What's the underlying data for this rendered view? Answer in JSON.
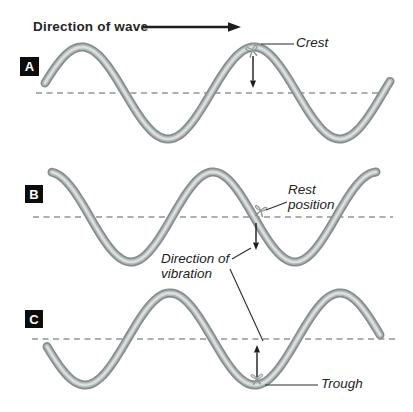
{
  "header": {
    "label": "Direction of wave"
  },
  "panels": [
    {
      "letter": "A"
    },
    {
      "letter": "B"
    },
    {
      "letter": "C"
    }
  ],
  "labels": {
    "crest": "Crest",
    "rest_position": "Rest\nposition",
    "direction_of_vibration": "Direction of\nvibration",
    "trough": "Trough"
  },
  "colors": {
    "background": "#ffffff",
    "rope_outer": "#868c8c",
    "rope_mid": "#b2b8b8",
    "rope_core": "#dbdfdf",
    "rest_line": "#8f9595",
    "arrow": "#1c1c1c",
    "text": "#222222",
    "panel_box": "#0c0c0c",
    "panel_letter": "#ffffff"
  },
  "diagram": {
    "header_arrow": {
      "x1": 143,
      "y1": 27,
      "x2": 241,
      "y2": 27
    },
    "rest_lines": [
      {
        "panel": "A",
        "y": 93,
        "x1": 36,
        "x2": 392
      },
      {
        "panel": "B",
        "y": 217,
        "x1": 33,
        "x2": 393
      },
      {
        "panel": "C",
        "y": 339,
        "x1": 32,
        "x2": 396
      }
    ],
    "waves": [
      {
        "panel": "A",
        "rest_y": 93,
        "amplitude": 46,
        "wavelength": 172,
        "ref_x": 254,
        "ref": "crest",
        "x_start": 45,
        "x_end": 391
      },
      {
        "panel": "B",
        "rest_y": 217,
        "amplitude": 45,
        "wavelength": 164,
        "ref_x": 213,
        "ref": "crest",
        "x_start": 52,
        "x_end": 376
      },
      {
        "panel": "C",
        "rest_y": 339,
        "amplitude": 46,
        "wavelength": 170,
        "ref_x": 255,
        "ref": "trough",
        "x_start": 47,
        "x_end": 380
      }
    ],
    "markers": [
      {
        "at": "crest",
        "x": 252,
        "y": 49,
        "rotate": -12
      },
      {
        "at": "rest-position",
        "x": 261,
        "y": 209,
        "rotate": 14
      },
      {
        "at": "trough",
        "x": 257,
        "y": 377,
        "rotate": 0
      }
    ],
    "vibration_arrows": [
      {
        "panel": "A",
        "x1": 253,
        "y1": 56,
        "x2": 253,
        "y2": 88
      },
      {
        "panel": "B",
        "x1": 256,
        "y1": 223,
        "x2": 256,
        "y2": 250
      },
      {
        "panel": "C",
        "x1": 257,
        "y1": 377,
        "x2": 257,
        "y2": 345
      }
    ],
    "pointer_lines": [
      {
        "label": "crest",
        "x1": 294,
        "y1": 44,
        "x2": 261,
        "y2": 44
      },
      {
        "label": "rest-position",
        "x1": 287,
        "y1": 202,
        "x2": 266,
        "y2": 210
      },
      {
        "label": "vibration-to-b",
        "x1": 232,
        "y1": 259,
        "x2": 251,
        "y2": 248
      },
      {
        "label": "vibration-to-c",
        "x1": 230,
        "y1": 269,
        "x2": 263,
        "y2": 341
      },
      {
        "label": "trough",
        "x1": 318,
        "y1": 385,
        "x2": 265,
        "y2": 385
      }
    ]
  }
}
